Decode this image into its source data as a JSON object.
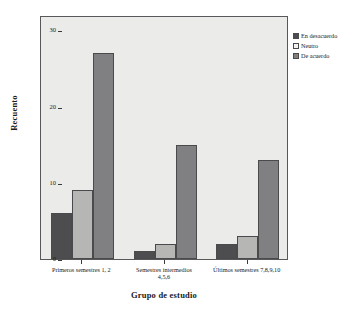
{
  "chart_data": {
    "type": "bar",
    "title": "",
    "xlabel": "Grupo de estudio",
    "ylabel": "Recuento",
    "ylim": [
      0,
      32
    ],
    "yticks": [
      0,
      10,
      20,
      30
    ],
    "grid": false,
    "legend_position": "right",
    "categories": [
      "Primeros semestres 1, 2",
      "Semestres intermedios\n4,5,6",
      "Últimos semestres 7,8,9,10"
    ],
    "series": [
      {
        "name": "En desacuerdo",
        "color": "#4d4d4f",
        "values": [
          6,
          1,
          2
        ]
      },
      {
        "name": "Neutro",
        "color": "#b6b6b4",
        "values": [
          9,
          2,
          3
        ]
      },
      {
        "name": "De acuerdo",
        "color": "#808082",
        "values": [
          27,
          15,
          13
        ]
      }
    ]
  },
  "colors": {
    "plot_background": "#ebebe9",
    "page_background": "#ffffff",
    "axis": "#58585a",
    "series_0": "#4d4d4f",
    "series_1": "#b6b6b4",
    "series_2": "#808082"
  }
}
